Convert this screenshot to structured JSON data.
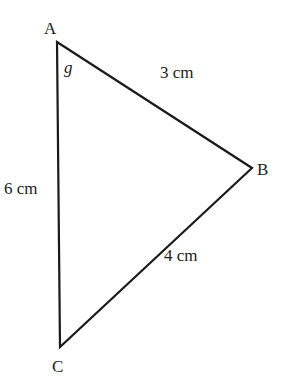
{
  "diagram": {
    "type": "triangle",
    "vertices": {
      "A": {
        "label": "A",
        "x": 57,
        "y": 42
      },
      "B": {
        "label": "B",
        "x": 252,
        "y": 168
      },
      "C": {
        "label": "C",
        "x": 60,
        "y": 347
      }
    },
    "sides": {
      "AB": {
        "label": "3 cm"
      },
      "BC": {
        "label": "4 cm"
      },
      "AC": {
        "label": "6 cm"
      }
    },
    "angle_label": "g",
    "stroke_color": "#1a1a1a"
  }
}
